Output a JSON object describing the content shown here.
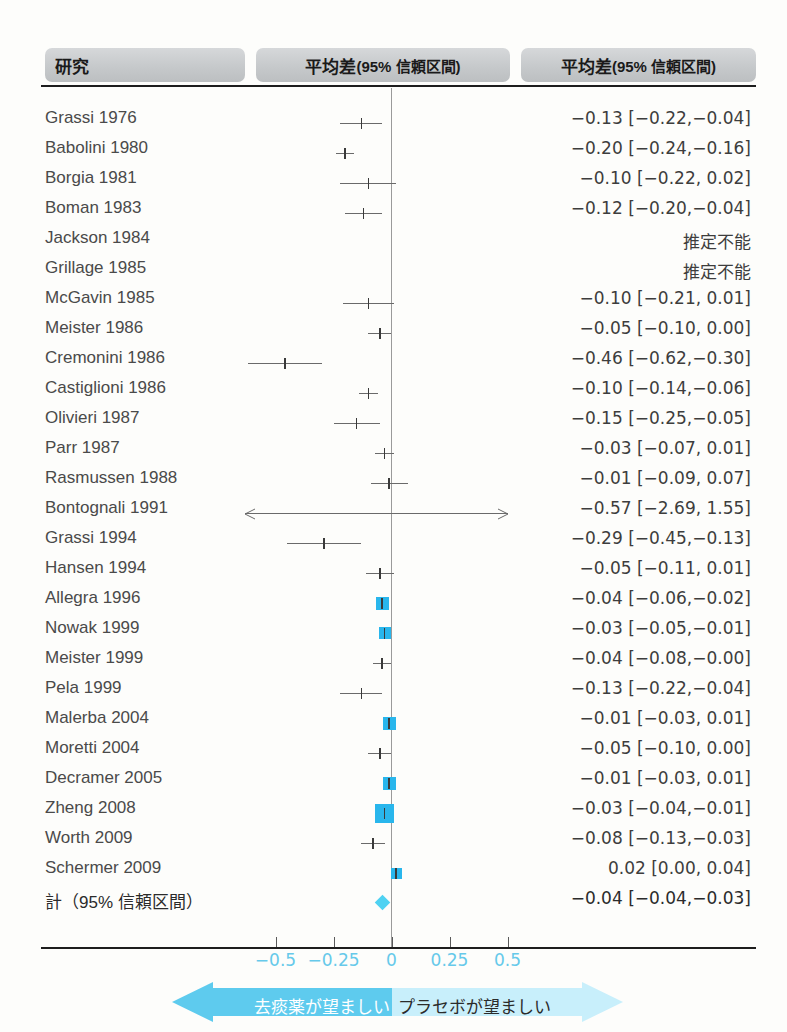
{
  "header": {
    "study_label": "研究",
    "plot_label_main": "平均差",
    "plot_label_sub": "(95% 信頼区間)",
    "result_label_main": "平均差",
    "result_label_sub": "(95% 信頼区間)"
  },
  "axis": {
    "ticks": [
      -0.5,
      -0.25,
      0,
      0.25,
      0.5
    ],
    "tick_labels": [
      "−0.5",
      "−0.25",
      "0",
      "0.25",
      "0.5"
    ],
    "range": [
      -0.65,
      0.65
    ],
    "tick_color": "#66c9ea"
  },
  "footer": {
    "left_label": "去痰薬が望ましい",
    "right_label": "プラセボが望ましい",
    "left_color": "#5ecbee",
    "right_color": "#c8effb"
  },
  "colors": {
    "box": "#29b6ec",
    "diamond": "#4fd2f2",
    "line": "#6a6a6a",
    "zero_line": "#9a9a9a",
    "header_bg": "#c6c9cb"
  },
  "chart_data": {
    "type": "forest",
    "title": "平均差(95% 信頼区間)",
    "xlabel": "",
    "ylabel": "",
    "xlim": [
      -0.65,
      0.65
    ],
    "xticks": [
      -0.5,
      -0.25,
      0,
      0.25,
      0.5
    ],
    "grid": false,
    "null_value": 0,
    "rows": [
      {
        "study": "Grassi 1976",
        "result": "−0.13 [−0.22,−0.04]",
        "est": -0.13,
        "lo": -0.22,
        "hi": -0.04,
        "box": 0,
        "estimable": true
      },
      {
        "study": "Babolini 1980",
        "result": "−0.20 [−0.24,−0.16]",
        "est": -0.2,
        "lo": -0.24,
        "hi": -0.16,
        "box": 0,
        "estimable": true
      },
      {
        "study": "Borgia 1981",
        "result": "−0.10 [−0.22, 0.02]",
        "est": -0.1,
        "lo": -0.22,
        "hi": 0.02,
        "box": 0,
        "estimable": true
      },
      {
        "study": "Boman 1983",
        "result": "−0.12 [−0.20,−0.04]",
        "est": -0.12,
        "lo": -0.2,
        "hi": -0.04,
        "box": 0,
        "estimable": true
      },
      {
        "study": "Jackson 1984",
        "result": "推定不能",
        "est": null,
        "lo": null,
        "hi": null,
        "box": 0,
        "estimable": false
      },
      {
        "study": "Grillage 1985",
        "result": "推定不能",
        "est": null,
        "lo": null,
        "hi": null,
        "box": 0,
        "estimable": false
      },
      {
        "study": "McGavin 1985",
        "result": "−0.10 [−0.21, 0.01]",
        "est": -0.1,
        "lo": -0.21,
        "hi": 0.01,
        "box": 0,
        "estimable": true
      },
      {
        "study": "Meister 1986",
        "result": "−0.05 [−0.10, 0.00]",
        "est": -0.05,
        "lo": -0.1,
        "hi": 0.0,
        "box": 0,
        "estimable": true
      },
      {
        "study": "Cremonini 1986",
        "result": "−0.46 [−0.62,−0.30]",
        "est": -0.46,
        "lo": -0.62,
        "hi": -0.3,
        "box": 0,
        "estimable": true
      },
      {
        "study": "Castiglioni 1986",
        "result": "−0.10 [−0.14,−0.06]",
        "est": -0.1,
        "lo": -0.14,
        "hi": -0.06,
        "box": 0,
        "estimable": true
      },
      {
        "study": "Olivieri 1987",
        "result": "−0.15 [−0.25,−0.05]",
        "est": -0.15,
        "lo": -0.25,
        "hi": -0.05,
        "box": 0,
        "estimable": true
      },
      {
        "study": "Parr 1987",
        "result": "−0.03 [−0.07, 0.01]",
        "est": -0.03,
        "lo": -0.07,
        "hi": 0.01,
        "box": 0,
        "estimable": true
      },
      {
        "study": "Rasmussen 1988",
        "result": "−0.01 [−0.09, 0.07]",
        "est": -0.01,
        "lo": -0.09,
        "hi": 0.07,
        "box": 0,
        "estimable": true
      },
      {
        "study": "Bontognali 1991",
        "result": "−0.57 [−2.69, 1.55]",
        "est": -0.57,
        "lo": -2.69,
        "hi": 1.55,
        "box": 0,
        "estimable": true,
        "clipped": true
      },
      {
        "study": "Grassi 1994",
        "result": "−0.29 [−0.45,−0.13]",
        "est": -0.29,
        "lo": -0.45,
        "hi": -0.13,
        "box": 0,
        "estimable": true
      },
      {
        "study": "Hansen 1994",
        "result": "−0.05 [−0.11, 0.01]",
        "est": -0.05,
        "lo": -0.11,
        "hi": 0.01,
        "box": 0,
        "estimable": true
      },
      {
        "study": "Allegra 1996",
        "result": "−0.04 [−0.06,−0.02]",
        "est": -0.04,
        "lo": -0.06,
        "hi": -0.02,
        "box": 13,
        "estimable": true
      },
      {
        "study": "Nowak 1999",
        "result": "−0.03 [−0.05,−0.01]",
        "est": -0.03,
        "lo": -0.05,
        "hi": -0.01,
        "box": 12,
        "estimable": true
      },
      {
        "study": "Meister 1999",
        "result": "−0.04 [−0.08,−0.00]",
        "est": -0.04,
        "lo": -0.08,
        "hi": -0.0,
        "box": 0,
        "estimable": true
      },
      {
        "study": "Pela 1999",
        "result": "−0.13 [−0.22,−0.04]",
        "est": -0.13,
        "lo": -0.22,
        "hi": -0.04,
        "box": 0,
        "estimable": true
      },
      {
        "study": "Malerba 2004",
        "result": "−0.01 [−0.03, 0.01]",
        "est": -0.01,
        "lo": -0.03,
        "hi": 0.01,
        "box": 13,
        "estimable": true
      },
      {
        "study": "Moretti 2004",
        "result": "−0.05 [−0.10, 0.00]",
        "est": -0.05,
        "lo": -0.1,
        "hi": 0.0,
        "box": 0,
        "estimable": true
      },
      {
        "study": "Decramer 2005",
        "result": "−0.01 [−0.03, 0.01]",
        "est": -0.01,
        "lo": -0.03,
        "hi": 0.01,
        "box": 13,
        "estimable": true
      },
      {
        "study": "Zheng 2008",
        "result": "−0.03 [−0.04,−0.01]",
        "est": -0.03,
        "lo": -0.04,
        "hi": -0.01,
        "box": 19,
        "estimable": true
      },
      {
        "study": "Worth 2009",
        "result": "−0.08 [−0.13,−0.03]",
        "est": -0.08,
        "lo": -0.13,
        "hi": -0.03,
        "box": 0,
        "estimable": true
      },
      {
        "study": "Schermer 2009",
        "result": "0.02 [0.00, 0.04]",
        "est": 0.02,
        "lo": 0.0,
        "hi": 0.04,
        "box": 11,
        "estimable": true
      }
    ],
    "summary": {
      "study": "計（95% 信頼区間）",
      "result": "−0.04 [−0.04,−0.03]",
      "est": -0.04,
      "lo": -0.04,
      "hi": -0.03
    }
  }
}
